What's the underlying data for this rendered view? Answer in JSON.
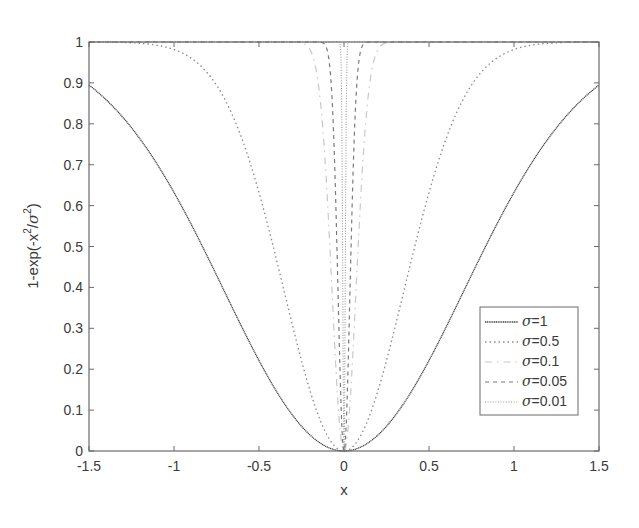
{
  "chart_data": {
    "type": "line",
    "title": "",
    "xlabel": "x",
    "ylabel": "1-exp(-x^2/σ^2)",
    "xlim": [
      -1.5,
      1.5
    ],
    "ylim": [
      0,
      1
    ],
    "grid": false,
    "legend_position": "lower right (inside)",
    "x_ticks": [
      "-1.5",
      "-1",
      "-0.5",
      "0",
      "0.5",
      "1",
      "1.5"
    ],
    "y_ticks": [
      "0",
      "0.1",
      "0.2",
      "0.3",
      "0.4",
      "0.5",
      "0.6",
      "0.7",
      "0.8",
      "0.9",
      "1"
    ],
    "function": "1-exp(-x^2/sigma^2)",
    "x": [
      -1.5,
      -1,
      -0.5,
      0,
      0.5,
      1,
      1.5
    ],
    "series": [
      {
        "name": "σ=1",
        "sigma": 1,
        "style": "solid-dense",
        "color": "#444444",
        "values": [
          0.8946,
          0.6321,
          0.2212,
          0,
          0.2212,
          0.6321,
          0.8946
        ]
      },
      {
        "name": "σ=0.5",
        "sigma": 0.5,
        "style": "dotted",
        "color": "#8a8a8a",
        "values": [
          0.9999,
          0.9817,
          0.6321,
          0,
          0.6321,
          0.9817,
          0.9999
        ]
      },
      {
        "name": "σ=0.1",
        "sigma": 0.1,
        "style": "dash-dot-light",
        "color": "#c8c8c8",
        "values": [
          1,
          1,
          1,
          0,
          1,
          1,
          1
        ]
      },
      {
        "name": "σ=0.05",
        "sigma": 0.05,
        "style": "dashed",
        "color": "#7a7a7a",
        "values": [
          1,
          1,
          1,
          0,
          1,
          1,
          1
        ]
      },
      {
        "name": "σ=0.01",
        "sigma": 0.01,
        "style": "dotted-fine",
        "color": "#9a9a9a",
        "values": [
          1,
          1,
          1,
          0,
          1,
          1,
          1
        ]
      }
    ]
  },
  "axes": {
    "xlabel": "x",
    "ylabel_prefix": "1-exp(-x",
    "ylabel_sup1": "2",
    "ylabel_mid": "/",
    "ylabel_sigma": "σ",
    "ylabel_sup2": "2",
    "ylabel_suffix": ")"
  },
  "legend": {
    "entries": [
      {
        "sigma_symbol": "σ",
        "text": "=1"
      },
      {
        "sigma_symbol": "σ",
        "text": "=0.5"
      },
      {
        "sigma_symbol": "σ",
        "text": "=0.1"
      },
      {
        "sigma_symbol": "σ",
        "text": "=0.05"
      },
      {
        "sigma_symbol": "σ",
        "text": "=0.01"
      }
    ]
  },
  "colors": {
    "axis": "#6a6a6a",
    "background": "#ffffff",
    "text": "#3a3a3a"
  }
}
